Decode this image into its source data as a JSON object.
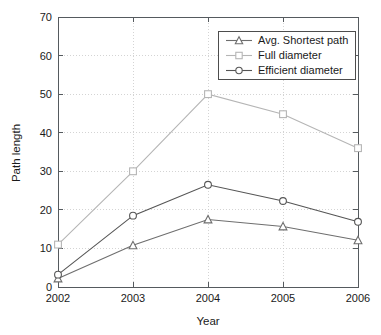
{
  "chart_data": {
    "type": "line",
    "title": "",
    "xlabel": "Year",
    "ylabel": "Path length",
    "categories": [
      "2002",
      "2003",
      "2004",
      "2005",
      "2006"
    ],
    "x": [
      2002,
      2003,
      2004,
      2005,
      2006
    ],
    "xlim": [
      2002,
      2006
    ],
    "ylim": [
      0,
      70
    ],
    "yticks": [
      0,
      10,
      20,
      30,
      40,
      50,
      60,
      70
    ],
    "ytick_labels": [
      "0",
      "10",
      "20",
      "30",
      "40",
      "50",
      "60",
      "70"
    ],
    "xticks": [
      2002,
      2003,
      2004,
      2005,
      2006
    ],
    "xtick_labels": [
      "2002",
      "2003",
      "2004",
      "2005",
      "2006"
    ],
    "grid": true,
    "grid_style": "dotted",
    "legend_position": "top-right-inside",
    "series": [
      {
        "name": "Avg. Shortest path",
        "marker": "triangle",
        "color": "#6e6e6e",
        "values": [
          2.2,
          10.8,
          17.5,
          15.7,
          12.1
        ]
      },
      {
        "name": "Full diameter",
        "marker": "square",
        "color": "#b5b5b5",
        "values": [
          11.0,
          30.0,
          50.0,
          44.8,
          36.0
        ]
      },
      {
        "name": "Efficient diameter",
        "marker": "circle",
        "color": "#555555",
        "values": [
          3.2,
          18.5,
          26.5,
          22.3,
          16.9
        ]
      }
    ]
  },
  "figure": {
    "background": "#ffffff",
    "axis_color": "#555a5e",
    "grid_color": "#c9c9c9",
    "text_color": "#1a1a1a"
  },
  "legend": {
    "entries": [
      {
        "label": "Avg. Shortest path"
      },
      {
        "label": "Full diameter"
      },
      {
        "label": "Efficient diameter"
      }
    ]
  }
}
